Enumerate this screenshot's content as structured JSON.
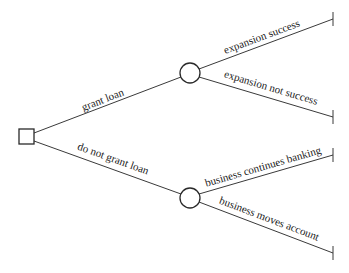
{
  "diagram": {
    "type": "decision-tree",
    "colors": {
      "line": "#3a3a3a",
      "text": "#222222",
      "background": "#ffffff"
    },
    "root": {
      "shape": "square",
      "kind": "decision"
    },
    "branches": [
      {
        "label": "grant loan",
        "node": {
          "shape": "circle",
          "kind": "chance"
        },
        "outcomes": [
          {
            "label": "expansion success"
          },
          {
            "label": "expansion not success"
          }
        ]
      },
      {
        "label": "do not grant loan",
        "node": {
          "shape": "circle",
          "kind": "chance"
        },
        "outcomes": [
          {
            "label": "business continues banking"
          },
          {
            "label": "business moves account"
          }
        ]
      }
    ]
  }
}
